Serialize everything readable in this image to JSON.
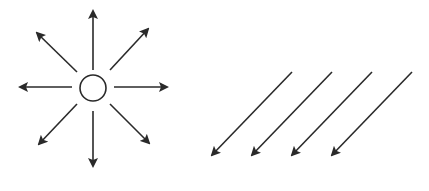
{
  "diagram": {
    "stroke_color": "#2a2a2a",
    "background": "#ffffff",
    "radial_figure": {
      "name": "point-source",
      "center": [
        93,
        88
      ],
      "circle_radius": 13,
      "arrows": [
        {
          "direction": "up",
          "from": [
            93,
            70
          ],
          "to": [
            93,
            11
          ]
        },
        {
          "direction": "up-right",
          "from": [
            110,
            70
          ],
          "to": [
            148,
            29
          ]
        },
        {
          "direction": "right",
          "from": [
            114,
            87
          ],
          "to": [
            167,
            87
          ]
        },
        {
          "direction": "down-right",
          "from": [
            110,
            104
          ],
          "to": [
            149,
            143
          ]
        },
        {
          "direction": "down",
          "from": [
            93,
            111
          ],
          "to": [
            93,
            166
          ]
        },
        {
          "direction": "down-left",
          "from": [
            77,
            104
          ],
          "to": [
            39,
            144
          ]
        },
        {
          "direction": "left",
          "from": [
            72,
            87
          ],
          "to": [
            20,
            87
          ]
        },
        {
          "direction": "up-left",
          "from": [
            77,
            72
          ],
          "to": [
            37,
            33
          ]
        }
      ]
    },
    "parallel_figure": {
      "name": "uniform-field",
      "arrows": [
        {
          "from": [
            292,
            72
          ],
          "to": [
            212,
            155
          ]
        },
        {
          "from": [
            332,
            72
          ],
          "to": [
            252,
            155
          ]
        },
        {
          "from": [
            372,
            72
          ],
          "to": [
            292,
            155
          ]
        },
        {
          "from": [
            412,
            72
          ],
          "to": [
            332,
            155
          ]
        }
      ]
    }
  }
}
